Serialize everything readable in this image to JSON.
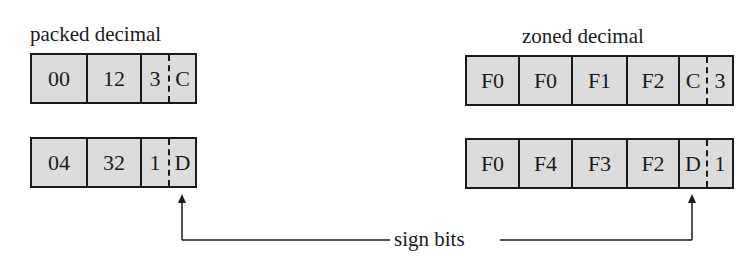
{
  "packed": {
    "title": "packed decimal",
    "rows": [
      {
        "bytes": [
          "00",
          "12"
        ],
        "digit": "3",
        "sign": "C"
      },
      {
        "bytes": [
          "04",
          "32"
        ],
        "digit": "1",
        "sign": "D"
      }
    ]
  },
  "zoned": {
    "title": "zoned decimal",
    "rows": [
      {
        "bytes": [
          "F0",
          "F0",
          "F1",
          "F2"
        ],
        "sign": "C",
        "digit": "3"
      },
      {
        "bytes": [
          "F0",
          "F4",
          "F3",
          "F2"
        ],
        "sign": "D",
        "digit": "1"
      }
    ]
  },
  "connector": {
    "label": "sign bits"
  },
  "colors": {
    "cell_fill": "#dcdcdc",
    "line": "#1a1a1a"
  }
}
